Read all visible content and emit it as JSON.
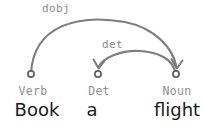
{
  "diagram": {
    "type": "dependency-parse",
    "sentence": "Book a flight",
    "background_color": "#ffffff",
    "arc_color": "#7d7d7d",
    "label_color": "#8a8a8a",
    "word_color": "#1a1a1a",
    "tokens": [
      {
        "word": "Book",
        "pos": "Verb",
        "x": 31
      },
      {
        "word": "a",
        "pos": "Det",
        "x": 98
      },
      {
        "word": "flight",
        "pos": "Noun",
        "x": 176
      }
    ],
    "relations": [
      {
        "label": "dobj",
        "head": "Verb",
        "dependent": "Noun",
        "direction": "left-to-right",
        "label_x": 42,
        "label_y": 3
      },
      {
        "label": "det",
        "head": "Noun",
        "dependent": "Det",
        "direction": "right-to-left",
        "label_x": 102,
        "label_y": 39
      }
    ]
  }
}
